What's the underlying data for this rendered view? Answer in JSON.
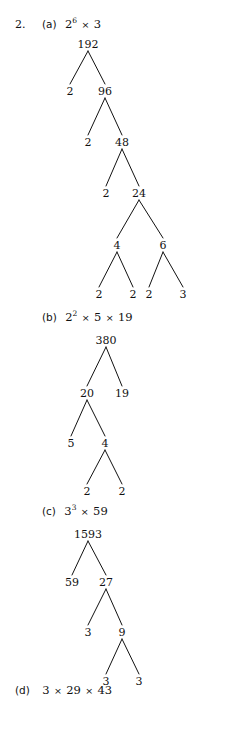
{
  "page": {
    "question_number": "2.",
    "background_color": "#ffffff",
    "ink_color": "#111111"
  },
  "parts": [
    {
      "id": "a",
      "marker": "(a)",
      "answer": {
        "text": "2⁶ × 3",
        "terms": [
          {
            "base": "2",
            "exponent": "6"
          },
          {
            "base": "3",
            "exponent": ""
          }
        ],
        "times_symbol": "×"
      },
      "tree": {
        "root": "192",
        "nodes": [
          {
            "id": "a0",
            "label": "192",
            "x": 88,
            "y": 44,
            "leaf": false
          },
          {
            "id": "a1",
            "label": "2",
            "x": 70,
            "y": 91,
            "leaf": true
          },
          {
            "id": "a2",
            "label": "96",
            "x": 105,
            "y": 91,
            "leaf": false
          },
          {
            "id": "a3",
            "label": "2",
            "x": 88,
            "y": 142,
            "leaf": true
          },
          {
            "id": "a4",
            "label": "48",
            "x": 122,
            "y": 142,
            "leaf": false
          },
          {
            "id": "a5",
            "label": "2",
            "x": 106,
            "y": 193,
            "leaf": true
          },
          {
            "id": "a6",
            "label": "24",
            "x": 139,
            "y": 193,
            "leaf": false
          },
          {
            "id": "a7",
            "label": "4",
            "x": 117,
            "y": 245,
            "leaf": false
          },
          {
            "id": "a8",
            "label": "6",
            "x": 163,
            "y": 245,
            "leaf": false
          },
          {
            "id": "a9",
            "label": "2",
            "x": 99,
            "y": 294,
            "leaf": true
          },
          {
            "id": "a10",
            "label": "2",
            "x": 133,
            "y": 294,
            "leaf": true
          },
          {
            "id": "a11",
            "label": "2",
            "x": 149,
            "y": 294,
            "leaf": true
          },
          {
            "id": "a12",
            "label": "3",
            "x": 183,
            "y": 294,
            "leaf": true
          }
        ],
        "edges": [
          {
            "from": "a0",
            "to": "a1"
          },
          {
            "from": "a0",
            "to": "a2"
          },
          {
            "from": "a2",
            "to": "a3"
          },
          {
            "from": "a2",
            "to": "a4"
          },
          {
            "from": "a4",
            "to": "a5"
          },
          {
            "from": "a4",
            "to": "a6"
          },
          {
            "from": "a6",
            "to": "a7"
          },
          {
            "from": "a6",
            "to": "a8"
          },
          {
            "from": "a7",
            "to": "a9"
          },
          {
            "from": "a7",
            "to": "a10"
          },
          {
            "from": "a8",
            "to": "a11"
          },
          {
            "from": "a8",
            "to": "a12"
          }
        ]
      }
    },
    {
      "id": "b",
      "marker": "(b)",
      "answer": {
        "text": "2² × 5 × 19",
        "terms": [
          {
            "base": "2",
            "exponent": "2"
          },
          {
            "base": "5",
            "exponent": ""
          },
          {
            "base": "19",
            "exponent": ""
          }
        ],
        "times_symbol": "×"
      },
      "tree": {
        "root": "380",
        "nodes": [
          {
            "id": "b0",
            "label": "380",
            "x": 106,
            "y": 340,
            "leaf": false
          },
          {
            "id": "b1",
            "label": "20",
            "x": 87,
            "y": 393,
            "leaf": false
          },
          {
            "id": "b2",
            "label": "19",
            "x": 122,
            "y": 393,
            "leaf": true
          },
          {
            "id": "b3",
            "label": "5",
            "x": 71,
            "y": 443,
            "leaf": true
          },
          {
            "id": "b4",
            "label": "4",
            "x": 105,
            "y": 443,
            "leaf": false
          },
          {
            "id": "b5",
            "label": "2",
            "x": 87,
            "y": 491,
            "leaf": true
          },
          {
            "id": "b6",
            "label": "2",
            "x": 122,
            "y": 491,
            "leaf": true
          }
        ],
        "edges": [
          {
            "from": "b0",
            "to": "b1"
          },
          {
            "from": "b0",
            "to": "b2"
          },
          {
            "from": "b1",
            "to": "b3"
          },
          {
            "from": "b1",
            "to": "b4"
          },
          {
            "from": "b4",
            "to": "b5"
          },
          {
            "from": "b4",
            "to": "b6"
          }
        ]
      }
    },
    {
      "id": "c",
      "marker": "(c)",
      "answer": {
        "text": "3³ × 59",
        "terms": [
          {
            "base": "3",
            "exponent": "3"
          },
          {
            "base": "59",
            "exponent": ""
          }
        ],
        "times_symbol": "×"
      },
      "tree": {
        "root": "1593",
        "nodes": [
          {
            "id": "c0",
            "label": "1593",
            "x": 88,
            "y": 534,
            "leaf": false
          },
          {
            "id": "c1",
            "label": "59",
            "x": 72,
            "y": 582,
            "leaf": true
          },
          {
            "id": "c2",
            "label": "27",
            "x": 106,
            "y": 582,
            "leaf": false
          },
          {
            "id": "c3",
            "label": "3",
            "x": 88,
            "y": 632,
            "leaf": true
          },
          {
            "id": "c4",
            "label": "9",
            "x": 122,
            "y": 632,
            "leaf": false
          },
          {
            "id": "c5",
            "label": "3",
            "x": 106,
            "y": 681,
            "leaf": true
          },
          {
            "id": "c6",
            "label": "3",
            "x": 139,
            "y": 681,
            "leaf": true
          }
        ],
        "edges": [
          {
            "from": "c0",
            "to": "c1"
          },
          {
            "from": "c0",
            "to": "c2"
          },
          {
            "from": "c2",
            "to": "c3"
          },
          {
            "from": "c2",
            "to": "c4"
          },
          {
            "from": "c4",
            "to": "c5"
          },
          {
            "from": "c4",
            "to": "c6"
          }
        ]
      }
    },
    {
      "id": "d",
      "marker": "(d)",
      "answer": {
        "text": "3 × 29 × 43",
        "terms": [
          {
            "base": "3",
            "exponent": ""
          },
          {
            "base": "29",
            "exponent": ""
          },
          {
            "base": "43",
            "exponent": ""
          }
        ],
        "times_symbol": "×"
      },
      "tree": null
    }
  ],
  "answer_lines": [
    {
      "id": "a",
      "marker": "(a)",
      "x": 42,
      "y": 19
    },
    {
      "id": "b",
      "marker": "(b)",
      "x": 42,
      "y": 312
    },
    {
      "id": "c",
      "marker": "(c)",
      "x": 42,
      "y": 506
    },
    {
      "id": "d",
      "marker": "(d)",
      "x": 15,
      "y": 685
    }
  ]
}
